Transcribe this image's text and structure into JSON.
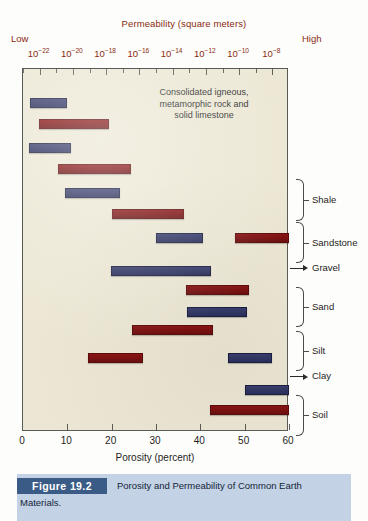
{
  "figure": {
    "caption_tab": "Figure 19.2",
    "caption_line1": "Porosity and Permeability of Common Earth",
    "caption_line2": "Materials."
  },
  "annotation": {
    "line1": "Consolidated igneous,",
    "line2": "metamorphic rock and",
    "line3": "solid limestone"
  },
  "colors": {
    "permeability_axis": "#8a2b12",
    "porosity_bar": "#2b2f5c",
    "permeability_bar": "#6d0f0f",
    "plot_background": "#ece7d4",
    "caption_band": "#c3d2e4",
    "caption_tab": "#3a5b86"
  },
  "chart_data": {
    "type": "bar",
    "orientation": "horizontal",
    "top_axis": {
      "label": "Permeability (square meters)",
      "low_label": "Low",
      "high_label": "High",
      "ticks": [
        {
          "exp": "-22",
          "base": "10"
        },
        {
          "exp": "-20",
          "base": "10"
        },
        {
          "exp": "-18",
          "base": "10"
        },
        {
          "exp": "-16",
          "base": "10"
        },
        {
          "exp": "-14",
          "base": "10"
        },
        {
          "exp": "-12",
          "base": "10"
        },
        {
          "exp": "-10",
          "base": "10"
        },
        {
          "exp": "-8",
          "base": "10"
        }
      ],
      "range": [
        "1e-23",
        "1e-7"
      ],
      "scale": "log"
    },
    "bottom_axis": {
      "label": "Porosity (percent)",
      "tick_labels": [
        "0",
        "10",
        "20",
        "30",
        "40",
        "50",
        "60"
      ],
      "ticks": [
        0,
        10,
        20,
        30,
        40,
        50,
        60
      ],
      "range": [
        0,
        60
      ],
      "scale": "linear"
    },
    "legend": [
      {
        "name": "Porosity",
        "color": "#2b2f5c"
      },
      {
        "name": "Permeability",
        "color": "#6d0f0f"
      }
    ],
    "grid": false,
    "groups": [
      {
        "label": "Consolidated igneous, metamorphic rock and solid limestone",
        "marker": "none",
        "bars": [
          {
            "series": "Porosity",
            "start_pct": 1.6,
            "end_pct": 10.0
          },
          {
            "series": "Permeability",
            "start_exp": -22.0,
            "end_exp": -18.5
          }
        ]
      },
      {
        "label": "Shale",
        "marker": "brace",
        "bars": [
          {
            "series": "Porosity",
            "start_pct": 1.4,
            "end_pct": 11.0
          },
          {
            "series": "Permeability",
            "start_exp": -20.6,
            "end_exp": -16.7
          }
        ]
      },
      {
        "label": "Sandstone",
        "marker": "brace",
        "bars": [
          {
            "series": "Porosity",
            "start_pct": 9.5,
            "end_pct": 22.0
          },
          {
            "series": "Permeability",
            "start_exp": -18.0,
            "end_exp": -14.2
          }
        ]
      },
      {
        "label": "Gravel",
        "marker": "arrow",
        "bars": [
          {
            "series": "Porosity",
            "start_pct": 30.0,
            "end_pct": 40.5
          },
          {
            "series": "Permeability",
            "start_exp": -10.2,
            "end_exp": -7.9
          }
        ]
      },
      {
        "label": "Sand",
        "marker": "brace",
        "bars": [
          {
            "series": "Porosity",
            "start_pct": 20.0,
            "end_pct": 42.5
          },
          {
            "series": "Permeability",
            "start_exp": -13.0,
            "end_exp": -10.4
          }
        ]
      },
      {
        "label": "Silt",
        "marker": "brace",
        "bars": [
          {
            "series": "Porosity",
            "start_pct": 37.0,
            "end_pct": 50.5
          },
          {
            "series": "Permeability",
            "start_exp": -16.3,
            "end_exp": -12.7
          }
        ]
      },
      {
        "label": "Clay",
        "marker": "arrow",
        "bars": [
          {
            "series": "Porosity",
            "start_pct": 46.0,
            "end_pct": 56.0
          },
          {
            "series": "Permeability",
            "start_exp": -19.4,
            "end_exp": -16.1
          }
        ]
      },
      {
        "label": "Soil",
        "marker": "brace",
        "bars": [
          {
            "series": "Porosity",
            "start_pct": 50.0,
            "end_pct": 60.0
          },
          {
            "series": "Permeability",
            "start_exp": -11.0,
            "end_exp": -7.9
          }
        ]
      }
    ],
    "bar_geometry": [
      {
        "group": "Consolidated",
        "series": "Porosity",
        "x0": 29,
        "x1": 66,
        "y": 97
      },
      {
        "group": "Consolidated",
        "series": "Permeability",
        "x0": 38,
        "x1": 108,
        "y": 118
      },
      {
        "group": "Shale",
        "series": "Porosity",
        "x0": 28,
        "x1": 70,
        "y": 142
      },
      {
        "group": "Shale",
        "series": "Permeability",
        "x0": 57,
        "x1": 130,
        "y": 163
      },
      {
        "group": "Sandstone",
        "series": "Porosity",
        "x0": 64,
        "x1": 119,
        "y": 187
      },
      {
        "group": "Sandstone",
        "series": "Permeability",
        "x0": 111,
        "x1": 183,
        "y": 208
      },
      {
        "group": "Gravel",
        "series": "Porosity",
        "x0": 155,
        "x1": 202,
        "y": 232
      },
      {
        "group": "Gravel",
        "series": "Permeability",
        "x0": 234,
        "x1": 288,
        "y": 232
      },
      {
        "group": "Sand",
        "series": "Porosity",
        "x0": 110,
        "x1": 210,
        "y": 265
      },
      {
        "group": "Sand",
        "series": "Permeability",
        "x0": 185,
        "x1": 248,
        "y": 284
      },
      {
        "group": "Silt",
        "series": "Porosity",
        "x0": 186,
        "x1": 246,
        "y": 306
      },
      {
        "group": "Silt",
        "series": "Permeability",
        "x0": 131,
        "x1": 212,
        "y": 324
      },
      {
        "group": "Clay",
        "series": "Porosity",
        "x0": 227,
        "x1": 271,
        "y": 352
      },
      {
        "group": "Clay",
        "series": "Permeability",
        "x0": 87,
        "x1": 142,
        "y": 352
      },
      {
        "group": "Soil",
        "series": "Porosity",
        "x0": 244,
        "x1": 288,
        "y": 384
      },
      {
        "group": "Soil",
        "series": "Permeability",
        "x0": 209,
        "x1": 288,
        "y": 404
      }
    ],
    "group_markers": [
      {
        "label": "Shale",
        "type": "brace",
        "top": 178,
        "bottom": 244
      },
      {
        "label": "Sandstone",
        "type": "brace",
        "top": 247,
        "bottom": 312
      },
      {
        "label": "Gravel",
        "type": "arrow",
        "y": 320
      },
      {
        "label": "Sand",
        "type": "brace",
        "top": 351,
        "bottom": 415
      },
      {
        "label": "Silt",
        "type": "brace",
        "top": 420,
        "bottom": 485
      },
      {
        "label": "Clay",
        "type": "arrow",
        "y": 493
      },
      {
        "label": "Soil",
        "type": "brace",
        "top": 523,
        "bottom": 588
      }
    ]
  }
}
